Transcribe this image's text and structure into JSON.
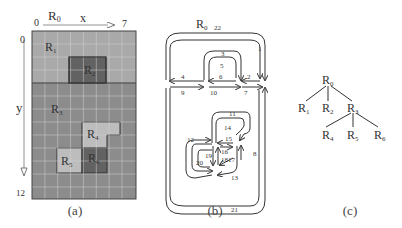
{
  "panel_a": {
    "caption": "(a)",
    "root_label": "R",
    "root_sub": "0",
    "x_axis": {
      "label": "x",
      "start": "0",
      "end": "7"
    },
    "y_axis": {
      "label": "y",
      "start": "0",
      "end": "12"
    },
    "grid": {
      "cols": 7,
      "rows": 13
    },
    "regions": [
      {
        "name": "R",
        "sub": "1"
      },
      {
        "name": "R",
        "sub": "2"
      },
      {
        "name": "R",
        "sub": "3"
      },
      {
        "name": "R",
        "sub": "4"
      },
      {
        "name": "R",
        "sub": "5"
      },
      {
        "name": "R",
        "sub": "6"
      }
    ],
    "colors": {
      "light": "#a9a9a9",
      "medium": "#8c8c8c",
      "dark": "#626262",
      "lighter": "#bdbdbd",
      "grid": "#d0d0d0",
      "border": "#333333"
    }
  },
  "panel_b": {
    "caption": "(b)",
    "root_label": "R",
    "root_sub": "0",
    "root_num": "22",
    "edge_labels": [
      "1",
      "2",
      "3",
      "4",
      "5",
      "6",
      "7",
      "8",
      "9",
      "10",
      "11",
      "12",
      "13",
      "14",
      "15",
      "16",
      "17",
      "18",
      "19",
      "20",
      "21"
    ]
  },
  "panel_c": {
    "caption": "(c)",
    "nodes": [
      {
        "name": "R",
        "sub": "0"
      },
      {
        "name": "R",
        "sub": "1"
      },
      {
        "name": "R",
        "sub": "2"
      },
      {
        "name": "R",
        "sub": "3"
      },
      {
        "name": "R",
        "sub": "4"
      },
      {
        "name": "R",
        "sub": "5"
      },
      {
        "name": "R",
        "sub": "6"
      }
    ]
  }
}
